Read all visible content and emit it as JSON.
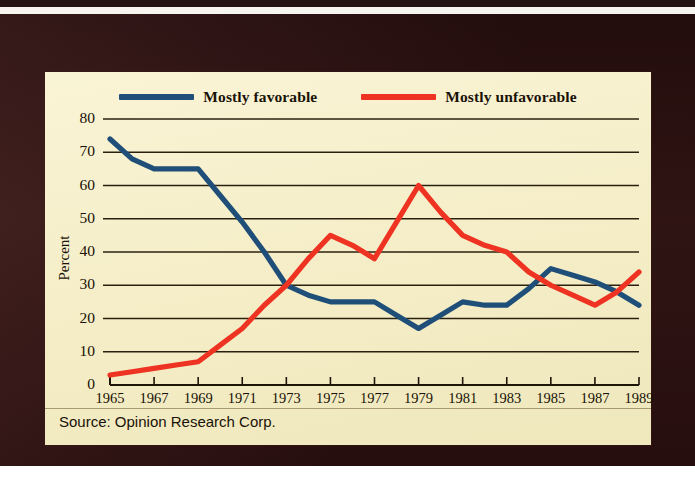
{
  "figure": {
    "source_note": "Source: Opinion Research Corp.",
    "ylabel": "Percent",
    "frame_color": "#361515",
    "panel_color": "#f7f0cd"
  },
  "legend": {
    "position": "top-center",
    "entries": [
      {
        "label": "Mostly favorable",
        "color": "#1f4e79",
        "icon": "line-swatch"
      },
      {
        "label": "Mostly unfavorable",
        "color": "#ee3322",
        "icon": "line-swatch"
      }
    ]
  },
  "chart_data": {
    "type": "line",
    "title": "",
    "subtitle": "",
    "xlabel": "",
    "ylabel": "Percent",
    "xlim": [
      1965,
      1989
    ],
    "ylim": [
      0,
      80
    ],
    "grid": true,
    "grid_axis": "y",
    "legend_position": "top-center",
    "annotations": [
      "Source: Opinion Research Corp."
    ],
    "x": [
      1965,
      1966,
      1967,
      1968,
      1969,
      1970,
      1971,
      1972,
      1973,
      1974,
      1975,
      1976,
      1977,
      1978,
      1979,
      1980,
      1981,
      1982,
      1983,
      1984,
      1985,
      1986,
      1987,
      1988,
      1989
    ],
    "xtick_labels": [
      "1965",
      "1967",
      "1969",
      "1971",
      "1973",
      "1975",
      "1977",
      "1979",
      "1981",
      "1983",
      "1985",
      "1987",
      "1989"
    ],
    "xticks": [
      1965,
      1967,
      1969,
      1971,
      1973,
      1975,
      1977,
      1979,
      1981,
      1983,
      1985,
      1987,
      1989
    ],
    "ytick_labels": [
      "0",
      "10",
      "20",
      "30",
      "40",
      "50",
      "60",
      "70",
      "80"
    ],
    "yticks": [
      0,
      10,
      20,
      30,
      40,
      50,
      60,
      70,
      80
    ],
    "series": [
      {
        "name": "Mostly favorable",
        "color": "#1f4e79",
        "values": [
          74,
          68,
          65,
          65,
          65,
          57,
          49,
          40,
          30,
          27,
          25,
          25,
          25,
          21,
          17,
          21,
          25,
          24,
          24,
          29,
          35,
          33,
          31,
          28,
          24
        ]
      },
      {
        "name": "Mostly unfavorable",
        "color": "#ee3322",
        "values": [
          3,
          4,
          5,
          6,
          7,
          12,
          17,
          24,
          30,
          38,
          45,
          42,
          38,
          49,
          60,
          52,
          45,
          42,
          40,
          34,
          30,
          27,
          24,
          28,
          34
        ]
      }
    ]
  },
  "ytick_items": [
    {
      "label": "80",
      "value": 80
    },
    {
      "label": "70",
      "value": 70
    },
    {
      "label": "60",
      "value": 60
    },
    {
      "label": "50",
      "value": 50
    },
    {
      "label": "40",
      "value": 40
    },
    {
      "label": "30",
      "value": 30
    },
    {
      "label": "20",
      "value": 20
    },
    {
      "label": "10",
      "value": 10
    },
    {
      "label": "0",
      "value": 0
    }
  ]
}
